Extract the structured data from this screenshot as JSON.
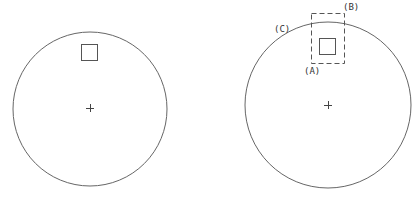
{
  "figure": {
    "left_panel": {
      "circle": {
        "cx": 90,
        "cy": 109,
        "r": 77
      },
      "center_mark": {
        "x": 90,
        "y": 108
      },
      "square": {
        "x": 81,
        "y": 44,
        "w": 17,
        "h": 16
      }
    },
    "right_panel": {
      "circle": {
        "cx": 328,
        "cy": 105,
        "r": 83
      },
      "center_mark": {
        "x": 328,
        "y": 105
      },
      "square": {
        "x": 319,
        "y": 38,
        "w": 17,
        "h": 16
      },
      "dashed_box": {
        "x": 311,
        "y": 14,
        "w": 33,
        "h": 50
      },
      "labels": {
        "a": "(A)",
        "b": "(B)",
        "c": "(C)"
      }
    },
    "colors": {
      "stroke": "#555555",
      "label": "#333333"
    }
  }
}
